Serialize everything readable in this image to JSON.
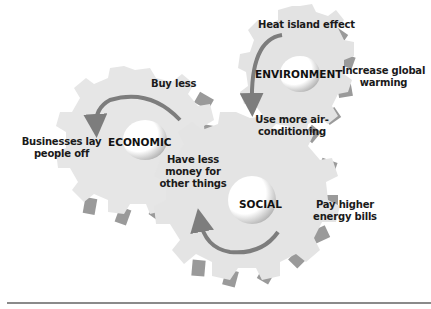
{
  "diagram": {
    "gears": [
      {
        "id": "economic",
        "label": "ECONOMIC"
      },
      {
        "id": "environment",
        "label": "ENVIRONMENT"
      },
      {
        "id": "social",
        "label": "SOCIAL"
      }
    ],
    "effects": {
      "heat_island": "Heat island effect",
      "increase_warming_1": "Increase global",
      "increase_warming_2": "warming",
      "air_con_1": "Use more air-",
      "air_con_2": "conditioning",
      "buy_less": "Buy less",
      "lay_off_1": "Businesses lay",
      "lay_off_2": "people off",
      "less_money_1": "Have less",
      "less_money_2": "money for",
      "less_money_3": "other things",
      "energy_bills_1": "Pay higher",
      "energy_bills_2": "energy bills"
    },
    "colors": {
      "gear_face": "#e6e6e6",
      "gear_side": "#9a9a9a",
      "arrow": "#7d7d7d",
      "text": "#1a1a1a",
      "rule": "#8a8a8a"
    }
  }
}
